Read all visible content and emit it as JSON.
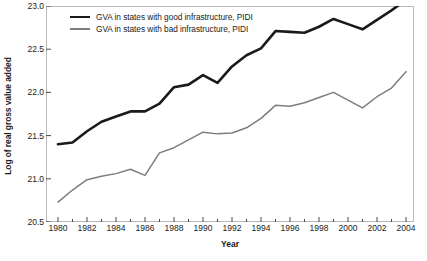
{
  "chart_data": {
    "type": "line",
    "title": "",
    "xlabel": "Year",
    "ylabel": "Log of real gross value added",
    "xlim": [
      1980,
      2004
    ],
    "ylim": [
      20.5,
      23.0
    ],
    "yticks": [
      "20.5",
      "21.0",
      "21.5",
      "22.0",
      "22.5",
      "23.0"
    ],
    "ytick_values": [
      20.5,
      21.0,
      21.5,
      22.0,
      22.5,
      23.0
    ],
    "xticks": [
      "1980",
      "1982",
      "1984",
      "1986",
      "1988",
      "1990",
      "1992",
      "1994",
      "1996",
      "1998",
      "2000",
      "2002",
      "2004"
    ],
    "xtick_values": [
      1980,
      1982,
      1984,
      1986,
      1988,
      1990,
      1992,
      1994,
      1996,
      1998,
      2000,
      2002,
      2004
    ],
    "grid": false,
    "legend_position": "top-left-inside",
    "x": [
      1980,
      1981,
      1982,
      1983,
      1984,
      1985,
      1986,
      1987,
      1988,
      1989,
      1990,
      1991,
      1992,
      1993,
      1994,
      1995,
      1996,
      1997,
      1998,
      1999,
      2000,
      2001,
      2002,
      2003,
      2004
    ],
    "series": [
      {
        "name": "GVA in states with good infrastructure, PIDI",
        "color": "#1a1a1a",
        "width": 2.6,
        "values": [
          21.4,
          21.42,
          21.55,
          21.66,
          21.72,
          21.78,
          21.78,
          21.87,
          22.06,
          22.09,
          22.2,
          22.11,
          22.3,
          22.43,
          22.51,
          22.71,
          22.7,
          22.69,
          22.76,
          22.85,
          22.79,
          22.73,
          22.84,
          22.95,
          23.07
        ]
      },
      {
        "name": "GVA in states with bad infrastructure, PIDI",
        "color": "#7d7d7d",
        "width": 1.5,
        "values": [
          20.73,
          20.87,
          20.99,
          21.03,
          21.06,
          21.11,
          21.04,
          21.3,
          21.36,
          21.45,
          21.54,
          21.52,
          21.53,
          21.59,
          21.7,
          21.85,
          21.84,
          21.88,
          21.94,
          22.0,
          21.91,
          21.82,
          21.95,
          22.05,
          22.24
        ]
      }
    ]
  },
  "legend": {
    "items": [
      {
        "label": "GVA in states with good infrastructure, PIDI",
        "color": "#1a1a1a",
        "thickness": "2.6px"
      },
      {
        "label": "GVA in states with bad infrastructure, PIDI",
        "color": "#7d7d7d",
        "thickness": "1.6px"
      }
    ]
  },
  "style": {
    "frame_color": "#b9b9b9",
    "tick_color": "#4a4a4a",
    "text_color": "#1a1a1a",
    "background": "#ffffff"
  }
}
